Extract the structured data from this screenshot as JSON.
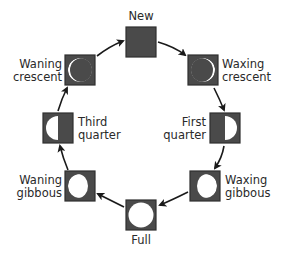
{
  "diagram": {
    "type": "cycle",
    "title": "",
    "direction": "clockwise",
    "colors": {
      "box_border": "#2f2f2f",
      "box_dark": "#4a4a4a",
      "moon_lit": "#ffffff",
      "arrow": "#1a1a1a",
      "text": "#2a2a2a",
      "background": "#ffffff"
    },
    "phases": [
      {
        "id": "new",
        "lines": [
          "New"
        ],
        "label_side": "top",
        "lit": "none"
      },
      {
        "id": "waxing-crescent",
        "lines": [
          "Waxing",
          "crescent"
        ],
        "label_side": "right",
        "lit": "thin-right"
      },
      {
        "id": "first-quarter",
        "lines": [
          "First",
          "quarter"
        ],
        "label_side": "left",
        "lit": "right-half"
      },
      {
        "id": "waxing-gibbous",
        "lines": [
          "Waxing",
          "gibbous"
        ],
        "label_side": "right",
        "lit": "mostly-right"
      },
      {
        "id": "full",
        "lines": [
          "Full"
        ],
        "label_side": "bottom",
        "lit": "full"
      },
      {
        "id": "waning-gibbous",
        "lines": [
          "Waning",
          "gibbous"
        ],
        "label_side": "left",
        "lit": "mostly-left"
      },
      {
        "id": "third-quarter",
        "lines": [
          "Third",
          "quarter"
        ],
        "label_side": "right",
        "lit": "left-half"
      },
      {
        "id": "waning-crescent",
        "lines": [
          "Waning",
          "crescent"
        ],
        "label_side": "left",
        "lit": "thin-left"
      }
    ]
  }
}
